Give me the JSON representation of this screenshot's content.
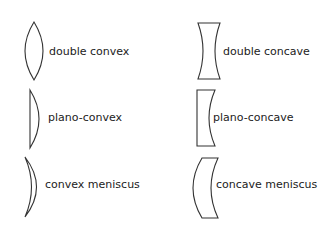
{
  "diagram": {
    "title": "",
    "stroke_color": "#333333",
    "lenses": [
      {
        "id": "double-convex",
        "label": "double convex"
      },
      {
        "id": "plano-convex",
        "label": "plano-convex"
      },
      {
        "id": "convex-meniscus",
        "label": "convex meniscus"
      },
      {
        "id": "double-concave",
        "label": "double concave"
      },
      {
        "id": "plano-concave",
        "label": "plano-concave"
      },
      {
        "id": "concave-meniscus",
        "label": "concave meniscus"
      }
    ]
  }
}
